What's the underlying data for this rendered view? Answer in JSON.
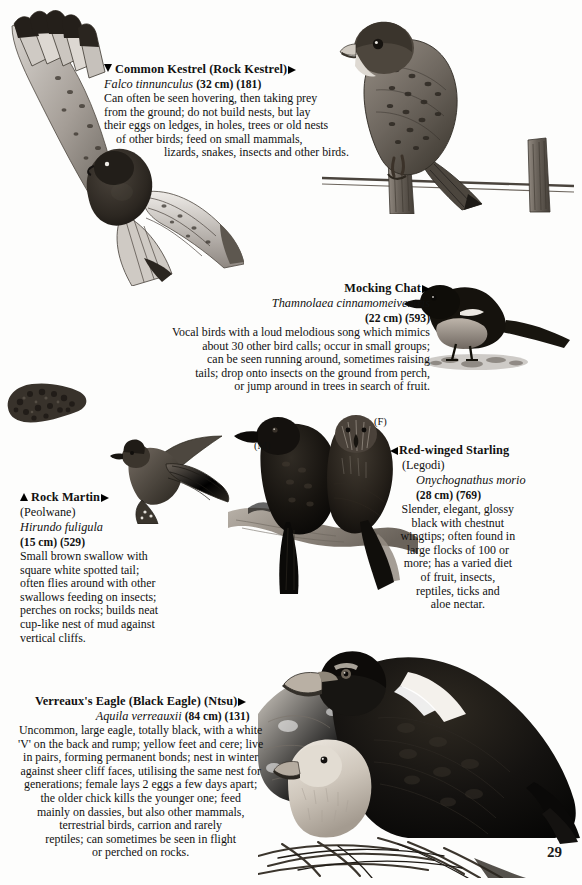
{
  "page": {
    "number": "29",
    "background": "#fdfdfc"
  },
  "species": [
    {
      "id": "common-kestrel",
      "common_name": "Common Kestrel (Rock Kestrel)",
      "local_name": "",
      "scientific_name": "Falco tinnunculus",
      "measurement": "(32 cm) (181)",
      "marker": "triangle-down",
      "pointer": "triangle-right",
      "description_lines": [
        "Can often be seen hovering, then taking prey",
        "from the ground; do not build nests, but lay",
        "their eggs on ledges, in holes, trees or old nests",
        "of other birds; feed on small mammals,",
        "lizards, snakes, insects and other birds."
      ]
    },
    {
      "id": "mocking-chat",
      "common_name": "Mocking Chat",
      "local_name": "",
      "scientific_name": "Thamnolaea cinnamomeiventris",
      "measurement": "(22 cm) (593)",
      "marker": "",
      "pointer": "triangle-right",
      "description_lines": [
        "Vocal birds with a loud melodious song which mimics",
        "about 30 other bird calls; occur in small groups;",
        "can be seen running around, sometimes raising",
        "tails; drop onto insects on the ground from perch,",
        "or jump around in trees in search of fruit."
      ]
    },
    {
      "id": "rock-martin",
      "common_name": "Rock Martin",
      "local_name": "(Peolwane)",
      "scientific_name": "Hirundo fuligula",
      "measurement": "(15 cm) (529)",
      "marker": "triangle-up",
      "pointer": "triangle-right",
      "description_lines": [
        "Small brown swallow with",
        "square white spotted tail;",
        "often flies around with other",
        "swallows feeding on insects;",
        "perches on rocks; builds neat",
        "cup-like nest of mud against",
        "vertical cliffs."
      ]
    },
    {
      "id": "red-winged-starling",
      "common_name": "Red-winged Starling",
      "local_name": "(Legodi)",
      "scientific_name": "Onychognathus morio",
      "measurement": "(28 cm) (769)",
      "marker": "",
      "pointer": "triangle-left",
      "description_lines": [
        "Slender, elegant, glossy",
        "black with chestnut",
        "wingtips; often found in",
        "large flocks of 100 or",
        "more; has a varied diet",
        "of fruit, insects,",
        "reptiles, ticks and",
        "aloe nectar."
      ],
      "sex_labels": [
        "(M)",
        "(F)"
      ]
    },
    {
      "id": "verreauxs-eagle",
      "common_name": "Verreaux's Eagle (Black Eagle) (Ntsu)",
      "local_name": "",
      "scientific_name": "Aquila verreauxii",
      "measurement": "(84 cm) (131)",
      "marker": "",
      "pointer": "triangle-right",
      "description_lines": [
        "Uncommon, large eagle, totally black, with a white",
        "'V' on the back and rump; yellow feet and cere; live",
        "in pairs, forming permanent bonds; nest in winter",
        "against sheer cliff faces, utilising the same nest for",
        "generations; female lays 2 eggs a few days apart;",
        "the older chick kills the younger one; feed",
        "mainly on dassies, but also other mammals,",
        "terrestrial birds, carrion and rarely",
        "reptiles; can sometimes be seen in flight",
        "or perched on rocks."
      ]
    }
  ],
  "illustrations": [
    {
      "id": "kestrel-flight",
      "caption": "Common Kestrel in flight, wings spread, seen from above"
    },
    {
      "id": "kestrel-perched",
      "caption": "Common Kestrel perched on a fence post with wire"
    },
    {
      "id": "mocking-chat",
      "caption": "Mocking Chat standing on the ground"
    },
    {
      "id": "martin-nest",
      "caption": "Rock Martin mud nest attached to rock"
    },
    {
      "id": "rock-martin",
      "caption": "Rock Martin in flight"
    },
    {
      "id": "starlings",
      "caption": "Pair of Red-winged Starlings perched on a branch"
    },
    {
      "id": "verreauxs-eagle",
      "caption": "Verreaux's Eagle adult with downy chick on a stick nest"
    }
  ]
}
